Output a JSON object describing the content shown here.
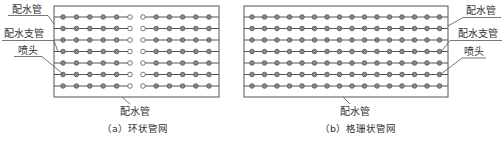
{
  "colors": {
    "line": "#555555",
    "nozzle_fill": "#888888",
    "open_nozzle_fill": "#ffffff",
    "text": "#333333",
    "background": "#ffffff"
  },
  "panel_a": {
    "caption": "（a）环状管网",
    "bottom_label": "配水管",
    "labels": {
      "main_pipe": "配水管",
      "branch_pipe": "配水支管",
      "nozzle": "喷头"
    },
    "rows": 7,
    "nozzles_per_half": 6,
    "layout": "ring"
  },
  "panel_b": {
    "caption": "（b）格珊状管网",
    "bottom_label": "配水管",
    "labels": {
      "main_pipe": "配水管",
      "branch_pipe": "配水支管",
      "nozzle": "喷头"
    },
    "rows": 7,
    "nozzles_per_row": 16,
    "layout": "grid"
  }
}
